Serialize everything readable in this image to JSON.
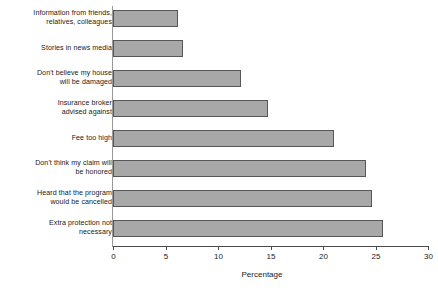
{
  "chart_data": {
    "type": "bar",
    "orientation": "horizontal",
    "title": "",
    "subtitle": "",
    "xlabel": "Percentage",
    "ylabel": "",
    "xlim": [
      0,
      30
    ],
    "xticks": [
      0,
      5,
      10,
      15,
      20,
      25,
      30
    ],
    "xtick_labels": [
      "0",
      "5",
      "10",
      "15",
      "20",
      "25",
      "30"
    ],
    "grid": false,
    "legend": null,
    "annotations": [],
    "categories": [
      "Information from friends,\nrelatives, colleagues",
      "Stories in news media",
      "Don't believe my house\nwill be damaged",
      "Insurance broker\nadvised against",
      "Fee too high",
      "Don't think my claim will\nbe honored",
      "Heard that the program\nwould be cancelled",
      "Extra protection not\nnecessary"
    ],
    "values": [
      6.2,
      6.7,
      12.2,
      14.8,
      21.0,
      24.1,
      24.7,
      25.7
    ],
    "bar_color": "#a8a8a8",
    "bar_edge_color": "#575757",
    "axis_color": "#4a4a4a",
    "text_color": "#1a1a1a",
    "background": "#ffffff"
  }
}
